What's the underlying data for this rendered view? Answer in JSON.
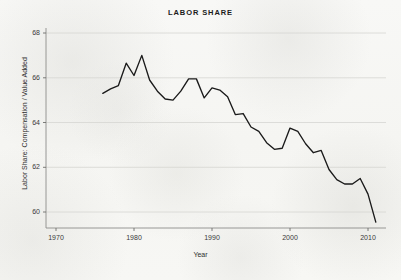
{
  "chart_data": {
    "type": "line",
    "title": "LABOR SHARE",
    "xlabel": "Year",
    "ylabel": "Labor Share: Compensation / Value Added",
    "xlim": [
      1970,
      2012
    ],
    "ylim": [
      59.3,
      68.2
    ],
    "xticks": [
      "1970",
      "1980",
      "1990",
      "2000",
      "2010"
    ],
    "xtick_values": [
      1970,
      1980,
      1990,
      2000,
      2010
    ],
    "yticks": [
      "60",
      "62",
      "64",
      "66",
      "68"
    ],
    "ytick_values": [
      60,
      62,
      64,
      66,
      68
    ],
    "gridlines": "horizontal",
    "legend": "none",
    "line_color": "#1a1a1a",
    "background_color": "#f7f7f5",
    "grid_color": "#d4d4d0",
    "series": [
      {
        "name": "Labor Share",
        "x": [
          1976,
          1977,
          1978,
          1979,
          1980,
          1981,
          1982,
          1983,
          1984,
          1985,
          1986,
          1987,
          1988,
          1989,
          1990,
          1991,
          1992,
          1993,
          1994,
          1995,
          1996,
          1997,
          1998,
          1999,
          2000,
          2001,
          2002,
          2003,
          2004,
          2005,
          2006,
          2007,
          2008,
          2009,
          2010,
          2011
        ],
        "values": [
          65.3,
          65.5,
          65.65,
          66.65,
          66.1,
          67.0,
          65.9,
          65.4,
          65.05,
          65.0,
          65.4,
          65.95,
          65.95,
          65.1,
          65.55,
          65.45,
          65.15,
          64.35,
          64.4,
          63.8,
          63.6,
          63.1,
          62.8,
          62.85,
          63.75,
          63.6,
          63.05,
          62.65,
          62.75,
          61.9,
          61.45,
          61.25,
          61.25,
          61.5,
          60.8,
          59.55
        ]
      }
    ]
  },
  "axes": {
    "y_tick_labels": [
      "68",
      "66",
      "64",
      "62",
      "60"
    ],
    "x_tick_labels": [
      "1970",
      "1980",
      "1990",
      "2000",
      "2010"
    ],
    "x_title": "Year",
    "y_title": "Labor Share: Compensation / Value Added"
  },
  "title": "LABOR SHARE"
}
